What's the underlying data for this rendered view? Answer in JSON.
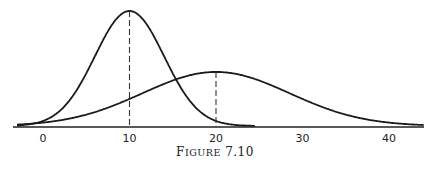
{
  "chart_data": {
    "type": "line",
    "title": "",
    "caption": "FIGURE 7.10",
    "xlabel": "",
    "ylabel": "",
    "xlim": [
      -3,
      44
    ],
    "grid": false,
    "legend": null,
    "x_ticks": [
      0,
      10,
      20,
      30,
      40
    ],
    "x_tick_labels": [
      "0",
      "10",
      "20",
      "30",
      "40"
    ],
    "series": [
      {
        "name": "narrow normal curve",
        "mean": 10,
        "sd": 4,
        "relative_peak_height": 1.0,
        "x_range": [
          -3,
          24.5
        ],
        "mean_marker": "dashed vertical line at x=10"
      },
      {
        "name": "wide normal curve",
        "mean": 20,
        "sd": 8.5,
        "relative_peak_height": 0.47,
        "x_range": [
          -3,
          44
        ],
        "mean_marker": "dashed vertical line at x=20"
      }
    ],
    "annotations": [
      "dashed line at mean 10",
      "dashed line at mean 20"
    ]
  },
  "figure": {
    "caption_prefix": "F",
    "caption_small": "IGURE",
    "caption_number": " 7.10"
  },
  "axis": {
    "ticks": [
      "0",
      "10",
      "20",
      "30",
      "40"
    ]
  }
}
